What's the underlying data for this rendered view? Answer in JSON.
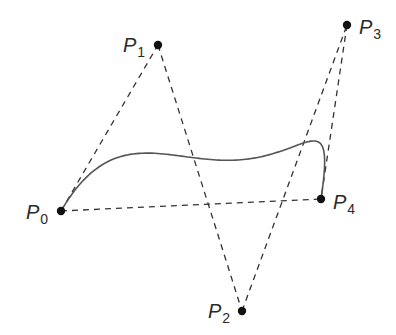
{
  "diagram": {
    "colors": {
      "stroke": "#333333",
      "curve": "#555555",
      "point": "#111111",
      "background": "#ffffff"
    },
    "points": [
      {
        "id": "P0",
        "base": "P",
        "sub": "0",
        "x": 61,
        "y": 211,
        "label_x": 26,
        "label_y": 219
      },
      {
        "id": "P1",
        "base": "P",
        "sub": "1",
        "x": 158,
        "y": 45,
        "label_x": 123,
        "label_y": 52
      },
      {
        "id": "P2",
        "base": "P",
        "sub": "2",
        "x": 242,
        "y": 311,
        "label_x": 208,
        "label_y": 318
      },
      {
        "id": "P3",
        "base": "P",
        "sub": "3",
        "x": 347,
        "y": 25,
        "label_x": 359,
        "label_y": 34
      },
      {
        "id": "P4",
        "base": "P",
        "sub": "4",
        "x": 321,
        "y": 199,
        "label_x": 333,
        "label_y": 209
      }
    ],
    "control_polygon": [
      "P0-P1",
      "P1-P2",
      "P2-P3",
      "P3-P4",
      "P0-P4"
    ],
    "curve_type": "quartic bezier"
  }
}
